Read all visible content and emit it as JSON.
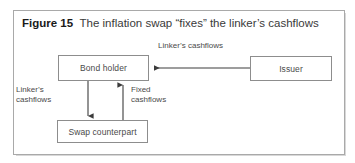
{
  "figure": {
    "caption_label": "Figure 15",
    "caption_text": "The inflation swap “fixes” the linker’s cashflows",
    "frame_border_color": "#a9a9a9",
    "background_color": "#ffffff",
    "text_color": "#4a4a4a",
    "line_color": "#3c3c3c"
  },
  "nodes": [
    {
      "id": "bond-holder",
      "label": "Bond holder"
    },
    {
      "id": "issuer",
      "label": "Issuer"
    },
    {
      "id": "swap-counterpart",
      "label": "Swap counterpart"
    }
  ],
  "edges": [
    {
      "id": "issuer-to-bond-holder",
      "from": "issuer",
      "to": "bond-holder",
      "direction": "left",
      "label": "Linker’s cashflows"
    },
    {
      "id": "bond-holder-to-swap-counterpart",
      "from": "bond-holder",
      "to": "swap-counterpart",
      "direction": "down",
      "label_line1": "Linker’s",
      "label_line2": "cashflows"
    },
    {
      "id": "swap-counterpart-to-bond-holder",
      "from": "swap-counterpart",
      "to": "bond-holder",
      "direction": "up",
      "label_line1": "Fixed",
      "label_line2": "cashflows"
    }
  ]
}
